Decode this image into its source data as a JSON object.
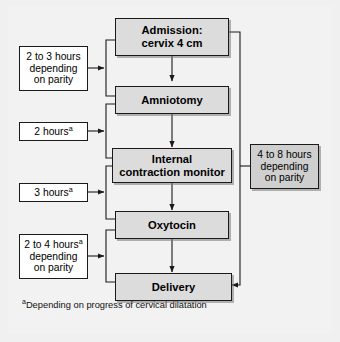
{
  "figure": {
    "background_color": "#f2f2f2",
    "main_box_fill": "#dcdcdc",
    "side_box_fill": "#ffffff",
    "highlight_box_fill": "#cfcfcf",
    "line_color": "#1a1a1a"
  },
  "flow": {
    "steps": [
      {
        "id": "admission",
        "line1": "Admission:",
        "line2": "cervix 4 cm"
      },
      {
        "id": "amniotomy",
        "line1": "Amniotomy",
        "line2": ""
      },
      {
        "id": "internal-contraction-monitor",
        "line1": "Internal",
        "line2": "contraction monitor"
      },
      {
        "id": "oxytocin",
        "line1": "Oxytocin",
        "line2": ""
      },
      {
        "id": "delivery",
        "line1": "Delivery",
        "line2": ""
      }
    ]
  },
  "intervals": [
    {
      "id": "admission-to-amniotomy",
      "line1": "2 to 3 hours",
      "line2": "depending",
      "line3": "on parity",
      "footnote_marker": ""
    },
    {
      "id": "amniotomy-to-monitor",
      "line1": "2 hours",
      "line2": "",
      "line3": "",
      "footnote_marker": "a"
    },
    {
      "id": "monitor-to-oxytocin",
      "line1": "3 hours",
      "line2": "",
      "line3": "",
      "footnote_marker": "a"
    },
    {
      "id": "oxytocin-to-delivery",
      "line1": "2 to 4 hours",
      "line2": "depending",
      "line3": "on parity",
      "footnote_marker": "a"
    }
  ],
  "total_interval": {
    "id": "admission-to-delivery",
    "line1": "4 to 8 hours",
    "line2": "depending",
    "line3": "on parity"
  },
  "footnote": {
    "marker": "a",
    "text": "Depending on progress of cervical dilatation"
  }
}
